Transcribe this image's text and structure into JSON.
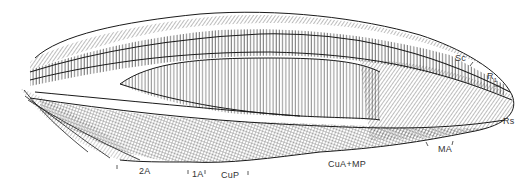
{
  "figure": {
    "labels": {
      "sc": "Sc",
      "r1_base": "R",
      "r1_sub": "1",
      "rs": "Rs",
      "ma": "MA",
      "cua_mp": "CuA+MP",
      "cup": "CuP",
      "a1": "1A",
      "a2": "2A"
    }
  },
  "colors": {
    "ink": "#1a1a1a",
    "background": "#ffffff"
  }
}
